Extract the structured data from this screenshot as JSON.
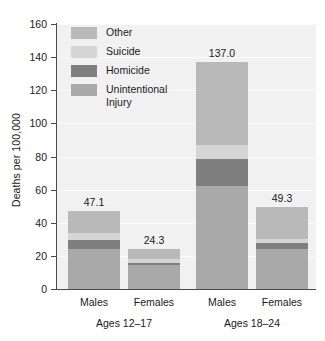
{
  "chart_data": {
    "type": "bar",
    "subtype": "stacked",
    "title": "",
    "xlabel": "",
    "ylabel": "Deaths per 100,000",
    "ylim": [
      0,
      160
    ],
    "yticks": [
      0,
      20,
      40,
      60,
      80,
      100,
      120,
      140,
      160
    ],
    "ytick_labels": [
      "0",
      "20",
      "40",
      "60",
      "80",
      "100",
      "120",
      "140",
      "160"
    ],
    "grid": true,
    "legend_position": "upper-left-inside",
    "categories": [
      "Males",
      "Females",
      "Males",
      "Females"
    ],
    "groups": [
      {
        "label": "Ages 12–17",
        "categories": [
          "Males",
          "Females"
        ]
      },
      {
        "label": "Ages 18–24",
        "categories": [
          "Males",
          "Females"
        ]
      }
    ],
    "series": [
      {
        "name": "Unintentional Injury",
        "color": "#a9a9a9",
        "values": [
          24.0,
          14.6,
          62.0,
          24.2
        ]
      },
      {
        "name": "Homicide",
        "color": "#7f7f7f",
        "values": [
          5.5,
          1.3,
          16.2,
          3.7
        ]
      },
      {
        "name": "Suicide",
        "color": "#d5d5d5",
        "values": [
          4.2,
          2.1,
          9.0,
          2.1
        ]
      },
      {
        "name": "Other",
        "color": "#b9b9b9",
        "values": [
          13.4,
          6.3,
          49.8,
          19.3
        ]
      }
    ],
    "totals": [
      47.1,
      24.3,
      137.0,
      49.3
    ],
    "total_labels": [
      "47.1",
      "24.3",
      "137.0",
      "49.3"
    ],
    "bar_totals_shown": true
  },
  "legend": {
    "items": [
      {
        "label": "Other",
        "color": "#b9b9b9"
      },
      {
        "label": "Suicide",
        "color": "#d5d5d5"
      },
      {
        "label": "Homicide",
        "color": "#7f7f7f"
      },
      {
        "label": "Unintentional\nInjury",
        "color": "#a9a9a9"
      }
    ]
  },
  "axis": {
    "y_title": "Deaths per 100,000",
    "y_tick_labels": [
      "160",
      "140",
      "120",
      "100",
      "80",
      "60",
      "40",
      "20",
      "0"
    ]
  },
  "bars": [
    {
      "category": "Males",
      "group": "Ages 12–17",
      "total_label": "47.1"
    },
    {
      "category": "Females",
      "group": "Ages 12–17",
      "total_label": "24.3"
    },
    {
      "category": "Males",
      "group": "Ages 18–24",
      "total_label": "137.0"
    },
    {
      "category": "Females",
      "group": "Ages 18–24",
      "total_label": "49.3"
    }
  ],
  "groups": [
    {
      "label": "Ages 12–17"
    },
    {
      "label": "Ages 18–24"
    }
  ],
  "colors": {
    "plot_background": "#f1f1f1",
    "gridline": "#fbfbfb",
    "axis": "#4a4a4a",
    "text": "#1a1a1a"
  }
}
